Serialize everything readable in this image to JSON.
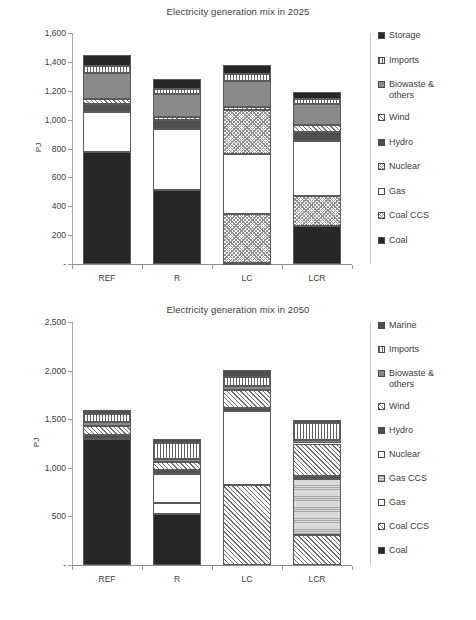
{
  "charts": [
    {
      "id": "chart-2025",
      "title": "Electricity generation mix in 2025",
      "ylabel": "PJ",
      "categories": [
        "REF",
        "R",
        "LC",
        "LCR"
      ],
      "y_ticks": [
        "-",
        "200",
        "400",
        "600",
        "800",
        "1,000",
        "1,200",
        "1,400",
        "1,600"
      ],
      "legend": [
        {
          "label": "Storage",
          "pattern": "p-solid-dark"
        },
        {
          "label": "Imports",
          "pattern": "p-vlines"
        },
        {
          "label": "Biowaste & others",
          "pattern": "p-mid-gray"
        },
        {
          "label": "Wind",
          "pattern": "p-diag-wide"
        },
        {
          "label": "Hydro",
          "pattern": "p-dark-gray"
        },
        {
          "label": "Nuclear",
          "pattern": "p-checker"
        },
        {
          "label": "Gas",
          "pattern": "p-white"
        },
        {
          "label": "Coal CCS",
          "pattern": "p-checker"
        },
        {
          "label": "Coal",
          "pattern": "p-solid-dark"
        }
      ]
    },
    {
      "id": "chart-2050",
      "title": "Electricity generation mix in 2050",
      "ylabel": "PJ",
      "categories": [
        "REF",
        "R",
        "LC",
        "LCR"
      ],
      "y_ticks": [
        "-",
        "500",
        "1,000",
        "1,500",
        "2,000",
        "2,500"
      ],
      "legend": [
        {
          "label": "Marine",
          "pattern": "p-dark-gray"
        },
        {
          "label": "Imports",
          "pattern": "p-vlines"
        },
        {
          "label": "Biowaste & others",
          "pattern": "p-mid-gray"
        },
        {
          "label": "Wind",
          "pattern": "p-diag-wide"
        },
        {
          "label": "Hydro",
          "pattern": "p-dark-gray"
        },
        {
          "label": "Nuclear",
          "pattern": "p-white"
        },
        {
          "label": "Gas CCS",
          "pattern": "p-gasccs"
        },
        {
          "label": "Gas",
          "pattern": "p-white"
        },
        {
          "label": "Coal CCS",
          "pattern": "p-diag-wide"
        },
        {
          "label": "Coal",
          "pattern": "p-solid-dark"
        }
      ]
    }
  ],
  "chart_data": [
    {
      "type": "bar",
      "subtype": "stacked-vertical",
      "title": "Electricity generation mix in 2025",
      "xlabel": "",
      "ylabel": "PJ",
      "ylim": [
        0,
        1600
      ],
      "ytick_step": 200,
      "grid": false,
      "legend_position": "right",
      "categories": [
        "REF",
        "R",
        "LC",
        "LCR"
      ],
      "series": [
        {
          "name": "Coal",
          "pattern": "p-solid-dark",
          "values": [
            775,
            510,
            10,
            265
          ]
        },
        {
          "name": "Coal CCS",
          "pattern": "p-checker",
          "values": [
            0,
            0,
            335,
            205
          ]
        },
        {
          "name": "Gas",
          "pattern": "p-white",
          "values": [
            280,
            425,
            415,
            385
          ]
        },
        {
          "name": "Nuclear",
          "pattern": "p-checker",
          "values": [
            0,
            0,
            310,
            0
          ]
        },
        {
          "name": "Hydro",
          "pattern": "p-dark-gray",
          "values": [
            55,
            65,
            0,
            60
          ]
        },
        {
          "name": "Wind",
          "pattern": "p-diag-wide",
          "values": [
            30,
            20,
            20,
            45
          ]
        },
        {
          "name": "Biowaste & others",
          "pattern": "p-mid-gray",
          "values": [
            180,
            155,
            175,
            145
          ]
        },
        {
          "name": "Imports",
          "pattern": "p-vlines",
          "values": [
            50,
            35,
            50,
            35
          ]
        },
        {
          "name": "Storage",
          "pattern": "p-solid-dark",
          "values": [
            75,
            70,
            65,
            50
          ]
        }
      ],
      "totals": [
        1445,
        1280,
        1380,
        1190
      ]
    },
    {
      "type": "bar",
      "subtype": "stacked-vertical",
      "title": "Electricity generation mix in 2050",
      "xlabel": "",
      "ylabel": "PJ",
      "ylim": [
        0,
        2500
      ],
      "ytick_step": 500,
      "grid": false,
      "legend_position": "right",
      "categories": [
        "REF",
        "R",
        "LC",
        "LCR"
      ],
      "series": [
        {
          "name": "Coal",
          "pattern": "p-solid-dark",
          "values": [
            1300,
            520,
            0,
            0
          ]
        },
        {
          "name": "Coal CCS",
          "pattern": "p-diag-wide",
          "values": [
            0,
            0,
            820,
            305
          ]
        },
        {
          "name": "Gas",
          "pattern": "p-white",
          "values": [
            0,
            120,
            0,
            0
          ]
        },
        {
          "name": "Gas CCS",
          "pattern": "p-gasccs",
          "values": [
            0,
            0,
            0,
            575
          ]
        },
        {
          "name": "Nuclear",
          "pattern": "p-white",
          "values": [
            0,
            300,
            760,
            0
          ]
        },
        {
          "name": "Hydro",
          "pattern": "p-dark-gray",
          "values": [
            35,
            40,
            35,
            40
          ]
        },
        {
          "name": "Wind",
          "pattern": "p-diag-wide",
          "values": [
            95,
            75,
            185,
            330
          ]
        },
        {
          "name": "Biowaste & others",
          "pattern": "p-mid-gray",
          "values": [
            45,
            35,
            40,
            40
          ]
        },
        {
          "name": "Imports",
          "pattern": "p-vlines",
          "values": [
            75,
            170,
            90,
            175
          ]
        },
        {
          "name": "Marine",
          "pattern": "p-dark-gray",
          "values": [
            45,
            35,
            75,
            30
          ]
        }
      ],
      "totals": [
        1595,
        1295,
        2005,
        1495
      ]
    }
  ]
}
